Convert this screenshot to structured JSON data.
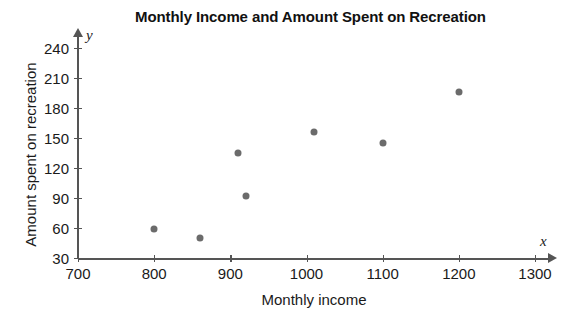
{
  "chart_data": {
    "type": "scatter",
    "title": "Monthly Income and Amount Spent on Recreation",
    "xlabel": "Monthly income",
    "ylabel": "Amount spent on recreation",
    "x_axis_variable": "x",
    "y_axis_variable": "y",
    "grid": false,
    "legend": null,
    "xlim": [
      700,
      1300
    ],
    "ylim": [
      30,
      240
    ],
    "xticks": [
      700,
      800,
      900,
      1000,
      1100,
      1200,
      1300
    ],
    "yticks": [
      30,
      60,
      90,
      120,
      150,
      180,
      210,
      240
    ],
    "xtick_labels": [
      "700",
      "800",
      "900",
      "1000",
      "1100",
      "1200",
      "1300"
    ],
    "ytick_labels": [
      "30",
      "60",
      "90",
      "120",
      "150",
      "180",
      "210",
      "240"
    ],
    "marker_color": "#6b6b6b",
    "axis_color": "#555555",
    "points": [
      {
        "x": 800,
        "y": 59
      },
      {
        "x": 860,
        "y": 50
      },
      {
        "x": 910,
        "y": 135
      },
      {
        "x": 920,
        "y": 92
      },
      {
        "x": 1010,
        "y": 156
      },
      {
        "x": 1100,
        "y": 145
      },
      {
        "x": 1200,
        "y": 196
      }
    ]
  }
}
